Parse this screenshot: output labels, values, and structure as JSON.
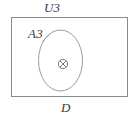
{
  "figure": {
    "type": "set-diagram",
    "background_color": "#ffffff",
    "stroke_color": "#8a8a8a",
    "label_color": "#3a3a3a",
    "outer_region": {
      "shape": "rectangle",
      "label_top": "U3",
      "label_bottom": "D"
    },
    "inner_region": {
      "shape": "ellipse",
      "label": "A3",
      "leader_line": true
    },
    "center_point": {
      "glyph": "⊗",
      "name": "circled-times"
    }
  },
  "labels": {
    "universe": "U3",
    "subset": "A3",
    "domain": "D",
    "point_symbol": "⊗"
  },
  "colors": {
    "stroke": "#8a8a8a",
    "ellipse_stroke": "#9a9a9a",
    "text": "#3a3a3a",
    "background": "#ffffff"
  }
}
